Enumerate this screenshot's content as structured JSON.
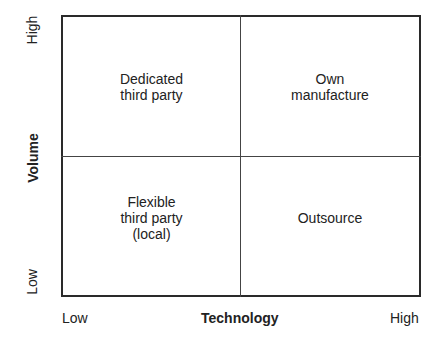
{
  "matrix": {
    "x_axis": {
      "title": "Technology",
      "low": "Low",
      "high": "High"
    },
    "y_axis": {
      "title": "Volume",
      "low": "Low",
      "high": "High"
    },
    "quadrants": {
      "top_left": [
        "Dedicated",
        "third party"
      ],
      "top_right": [
        "Own",
        "manufacture"
      ],
      "bottom_left": [
        "Flexible",
        "third party",
        "(local)"
      ],
      "bottom_right": [
        "Outsource"
      ]
    }
  }
}
